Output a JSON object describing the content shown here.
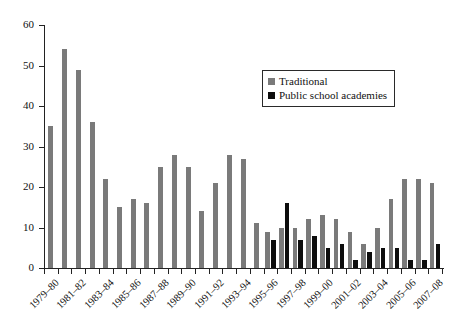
{
  "chart_data": {
    "type": "bar",
    "title": "",
    "subtitle": "",
    "xlabel": "",
    "ylabel": "",
    "ylim": [
      0,
      60
    ],
    "yticks": [
      0,
      10,
      20,
      30,
      40,
      50,
      60
    ],
    "grid": false,
    "legend_position": "upper-right",
    "categories": [
      "1979–80",
      "1980–81",
      "1981–82",
      "1982–83",
      "1983–84",
      "1984–85",
      "1985–86",
      "1986–87",
      "1987–88",
      "1988–89",
      "1989–90",
      "1990–91",
      "1991–92",
      "1992–93",
      "1993–94",
      "1994–95",
      "1995–96",
      "1996–97",
      "1997–98",
      "1998–99",
      "1999–00",
      "2000–01",
      "2001–02",
      "2002–03",
      "2003–04",
      "2004–05",
      "2005–06",
      "2006–07",
      "2007–08"
    ],
    "tick_labels": [
      "1979–80",
      "1981–82",
      "1983–84",
      "1985–86",
      "1987–88",
      "1989–90",
      "1991–92",
      "1993–94",
      "1995–96",
      "1997–98",
      "1999–00",
      "2001–02",
      "2003–04",
      "2005–06",
      "2007–08"
    ],
    "series": [
      {
        "name": "Traditional",
        "color": "#7a7a7a",
        "values": [
          35,
          54,
          49,
          36,
          22,
          15,
          17,
          16,
          25,
          28,
          25,
          14,
          21,
          28,
          27,
          11,
          9,
          10,
          10,
          12,
          13,
          12,
          9,
          6,
          10,
          17,
          22,
          22,
          21
        ]
      },
      {
        "name": "Public school academies",
        "color": "#0d0d0d",
        "values": [
          0,
          0,
          0,
          0,
          0,
          0,
          0,
          0,
          0,
          0,
          0,
          0,
          0,
          0,
          0,
          0,
          7,
          16,
          7,
          8,
          5,
          6,
          2,
          4,
          5,
          5,
          2,
          2,
          6
        ]
      }
    ]
  },
  "legend": {
    "items": [
      {
        "label": "Traditional",
        "color": "#7a7a7a"
      },
      {
        "label": "Public school academies",
        "color": "#0d0d0d"
      }
    ]
  }
}
